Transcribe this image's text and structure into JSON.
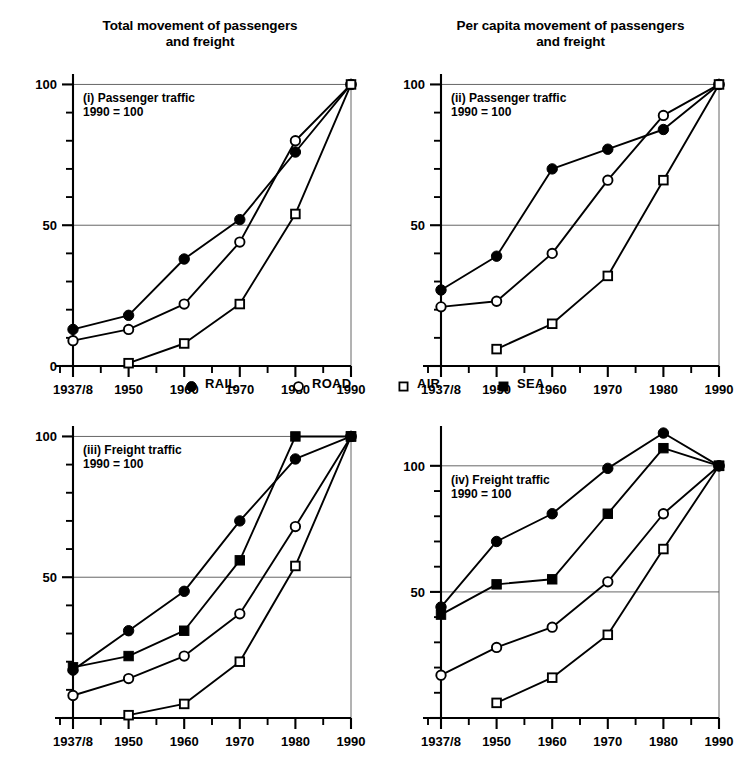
{
  "figure": {
    "titles": {
      "left": "Total movement of passengers and freight",
      "left_line1": "Total movement of passengers",
      "left_line2": "and freight",
      "right": "Per capita movement of passengers and freight",
      "right_line1": "Per capita movement of passengers",
      "right_line2": "and freight"
    }
  },
  "legend": {
    "items": [
      {
        "label": "RAIL",
        "marker": "filled-circle",
        "icon": "filled-circle-icon",
        "color": "#000000"
      },
      {
        "label": "ROAD",
        "marker": "open-circle",
        "icon": "open-circle-icon",
        "color": "#000000"
      },
      {
        "label": "AIR",
        "marker": "open-square",
        "icon": "open-square-icon",
        "color": "#000000"
      },
      {
        "label": "SEA",
        "marker": "filled-square",
        "icon": "filled-square-icon",
        "color": "#000000"
      }
    ]
  },
  "chart_data": [
    {
      "id": "panel-i",
      "type": "line",
      "title": "Total movement of passengers and freight",
      "panel_label": "(i) Passenger traffic",
      "panel_note": "1990 = 100",
      "xlabel": "",
      "ylabel": "",
      "categories": [
        "1937/8",
        "1950",
        "1960",
        "1970",
        "1980",
        "1990"
      ],
      "ytick_labels": [
        "0",
        "50",
        "100"
      ],
      "ytick_values": [
        0,
        50,
        100
      ],
      "ylim": [
        0,
        103
      ],
      "grid": "horizontal-at-50-and-100",
      "legend_position": "figure-center",
      "series": [
        {
          "name": "RAIL",
          "marker": "filled-circle",
          "values": [
            13,
            18,
            38,
            52,
            76,
            100
          ]
        },
        {
          "name": "ROAD",
          "marker": "open-circle",
          "values": [
            9,
            13,
            22,
            44,
            80,
            100
          ]
        },
        {
          "name": "AIR",
          "marker": "open-square",
          "values": [
            null,
            1,
            8,
            22,
            54,
            100
          ]
        },
        {
          "name": "SEA",
          "marker": "filled-square",
          "values": [
            null,
            null,
            null,
            null,
            null,
            null
          ]
        }
      ]
    },
    {
      "id": "panel-ii",
      "type": "line",
      "title": "Per capita movement of passengers and freight",
      "panel_label": "(ii) Passenger traffic",
      "panel_note": "1990 = 100",
      "xlabel": "",
      "ylabel": "",
      "categories": [
        "1937/8",
        "1950",
        "1960",
        "1970",
        "1980",
        "1990"
      ],
      "ytick_labels": [
        "50",
        "100"
      ],
      "ytick_values": [
        50,
        100
      ],
      "ylim": [
        0,
        103
      ],
      "grid": "horizontal-at-50-and-100",
      "legend_position": "figure-center",
      "series": [
        {
          "name": "RAIL",
          "marker": "filled-circle",
          "values": [
            27,
            39,
            70,
            77,
            84,
            100
          ]
        },
        {
          "name": "ROAD",
          "marker": "open-circle",
          "values": [
            21,
            23,
            40,
            66,
            89,
            100
          ]
        },
        {
          "name": "AIR",
          "marker": "open-square",
          "values": [
            null,
            6,
            15,
            32,
            66,
            100
          ]
        },
        {
          "name": "SEA",
          "marker": "filled-square",
          "values": [
            null,
            null,
            null,
            null,
            null,
            null
          ]
        }
      ]
    },
    {
      "id": "panel-iii",
      "type": "line",
      "title": "Total movement of passengers and freight",
      "panel_label": "(iii) Freight traffic",
      "panel_note": "1990 = 100",
      "xlabel": "",
      "ylabel": "",
      "categories": [
        "1937/8",
        "1950",
        "1960",
        "1970",
        "1980",
        "1990"
      ],
      "ytick_labels": [
        "50",
        "100"
      ],
      "ytick_values": [
        50,
        100
      ],
      "ylim": [
        0,
        103
      ],
      "grid": "horizontal-at-50-and-100",
      "legend_position": "figure-center",
      "series": [
        {
          "name": "RAIL",
          "marker": "filled-circle",
          "values": [
            17,
            31,
            45,
            70,
            92,
            100
          ]
        },
        {
          "name": "ROAD",
          "marker": "open-circle",
          "values": [
            8,
            14,
            22,
            37,
            68,
            100
          ]
        },
        {
          "name": "AIR",
          "marker": "open-square",
          "values": [
            null,
            1,
            5,
            20,
            54,
            100
          ]
        },
        {
          "name": "SEA",
          "marker": "filled-square",
          "values": [
            18,
            22,
            31,
            56,
            100,
            100
          ]
        }
      ]
    },
    {
      "id": "panel-iv",
      "type": "line",
      "title": "Per capita movement of passengers and freight",
      "panel_label": "(iv) Freight traffic",
      "panel_note": "1990 = 100",
      "xlabel": "",
      "ylabel": "",
      "categories": [
        "1937/8",
        "1950",
        "1960",
        "1970",
        "1980",
        "1990"
      ],
      "ytick_labels": [
        "50",
        "100"
      ],
      "ytick_values": [
        50,
        100
      ],
      "ylim": [
        0,
        115
      ],
      "grid": "horizontal-at-50-and-100",
      "legend_position": "figure-center",
      "series": [
        {
          "name": "RAIL",
          "marker": "filled-circle",
          "values": [
            44,
            70,
            81,
            99,
            113,
            100
          ]
        },
        {
          "name": "ROAD",
          "marker": "open-circle",
          "values": [
            17,
            28,
            36,
            54,
            81,
            100
          ]
        },
        {
          "name": "AIR",
          "marker": "open-square",
          "values": [
            null,
            6,
            16,
            33,
            67,
            100
          ]
        },
        {
          "name": "SEA",
          "marker": "filled-square",
          "values": [
            41,
            53,
            55,
            81,
            107,
            100
          ]
        }
      ]
    }
  ]
}
